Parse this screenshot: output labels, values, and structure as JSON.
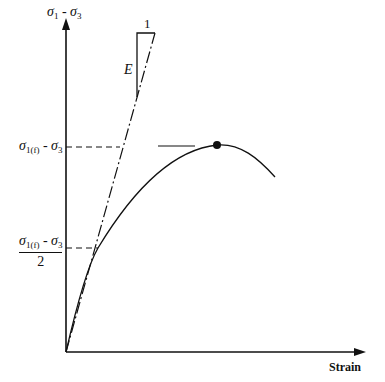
{
  "diagram": {
    "y_axis": {
      "label_main": "σ",
      "label_sub1": "1",
      "label_sep": " - ",
      "label_main2": "σ",
      "label_sub2": "3"
    },
    "x_axis": {
      "label": "Strain"
    },
    "annotations": {
      "peak_label": {
        "main": "σ",
        "sub": "1(f)",
        "sep": " - ",
        "main2": "σ",
        "sub2": "3"
      },
      "half_peak_label": {
        "main": "σ",
        "sub": "1(f)",
        "sep": " - ",
        "main2": "σ",
        "sub2": "3",
        "denominator": "2"
      },
      "slope_run": "1",
      "slope_rise": "E"
    },
    "colors": {
      "line": "#111111",
      "background": "#ffffff"
    }
  }
}
